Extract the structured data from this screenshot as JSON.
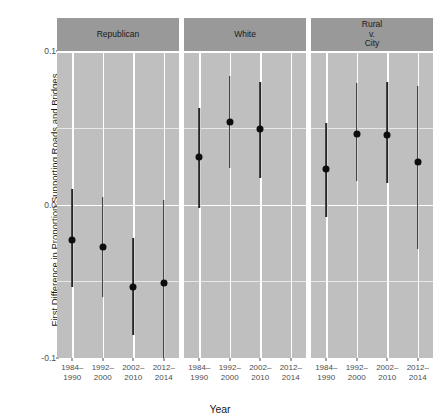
{
  "chart_data": {
    "type": "scatter",
    "title": "",
    "xlabel": "Year",
    "ylabel": "First Difference in Proportion Supporting Roads and Bridges",
    "ylim": [
      -0.1,
      0.1
    ],
    "y_ticks": [
      {
        "value": 0.1,
        "label": "0.1"
      },
      {
        "value": 0.0,
        "label": "0.0"
      },
      {
        "value": -0.1,
        "label": "-0.1"
      }
    ],
    "y_minor_gridlines": [
      0.05,
      -0.05
    ],
    "grid": true,
    "legend": "none",
    "categories": [
      "1984–\n1990",
      "1992–\n2000",
      "2002–\n2010",
      "2012–\n2014"
    ],
    "panels": [
      {
        "label": "Republican",
        "points": [
          {
            "x": "1984–\n1990",
            "estimate": -0.023,
            "low": 0.01,
            "high": -0.054
          },
          {
            "x": "1992–\n2000",
            "estimate": -0.028,
            "low": 0.005,
            "high": -0.06
          },
          {
            "x": "2002–\n2010",
            "estimate": -0.054,
            "low": -0.022,
            "high": -0.085
          },
          {
            "x": "2012–\n2014",
            "estimate": -0.051,
            "low": 0.003,
            "high": -0.101
          }
        ]
      },
      {
        "label": "White",
        "points": [
          {
            "x": "1984–\n1990",
            "estimate": 0.031,
            "low": 0.063,
            "high": -0.002
          },
          {
            "x": "1992–\n2000",
            "estimate": 0.054,
            "low": 0.084,
            "high": 0.024
          },
          {
            "x": "2002–\n2010",
            "estimate": 0.049,
            "low": 0.08,
            "high": 0.017
          },
          {
            "x": "2012–\n2014",
            "estimate": 0.143,
            "low": 0.181,
            "high": 0.106
          }
        ]
      },
      {
        "label": "Rural\nv.\nCity",
        "points": [
          {
            "x": "1984–\n1990",
            "estimate": 0.023,
            "low": 0.053,
            "high": -0.008
          },
          {
            "x": "1992–\n2000",
            "estimate": 0.046,
            "low": 0.079,
            "high": 0.015
          },
          {
            "x": "2002–\n2010",
            "estimate": 0.045,
            "low": 0.08,
            "high": 0.014
          },
          {
            "x": "2012–\n2014",
            "estimate": 0.028,
            "low": 0.077,
            "high": -0.029
          }
        ]
      }
    ],
    "colors": {
      "panel_background": "#bfbfbf",
      "strip_background": "#999999",
      "major_gridline": "#ffffff",
      "minor_gridline": "#e8e8e8",
      "point": "#0d0d0d",
      "errorbar": "#262626",
      "page_background": "#ffffff"
    }
  }
}
